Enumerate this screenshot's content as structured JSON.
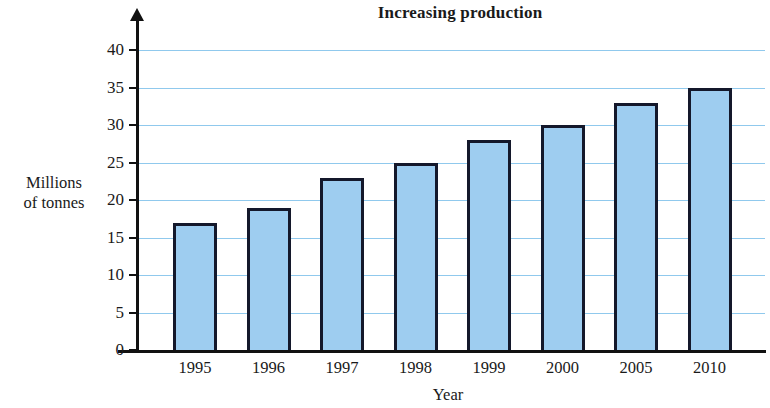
{
  "chart_data": {
    "type": "bar",
    "title": "Increasing production",
    "xlabel": "Year",
    "ylabel": "Millions of tonnes",
    "ylabel_lines": [
      "Millions",
      "of tonnes"
    ],
    "categories": [
      "1995",
      "1996",
      "1997",
      "1998",
      "1999",
      "2000",
      "2005",
      "2010"
    ],
    "values": [
      17,
      19,
      23,
      25,
      28,
      30,
      33,
      35
    ],
    "ylim": [
      0,
      40
    ],
    "ytick_values": [
      0,
      5,
      10,
      15,
      20,
      25,
      30,
      35,
      40
    ],
    "ytick_labels": [
      "0",
      "5",
      "10",
      "15",
      "20",
      "25",
      "30",
      "35",
      "40"
    ],
    "grid": true,
    "grid_axis": "y",
    "legend": false,
    "bar_color": "#9ecdf0",
    "bar_edge_color": "#14182b",
    "gridline_color": "#7cc0ea",
    "axis_color": "#111111",
    "background_color": "#ffffff"
  }
}
